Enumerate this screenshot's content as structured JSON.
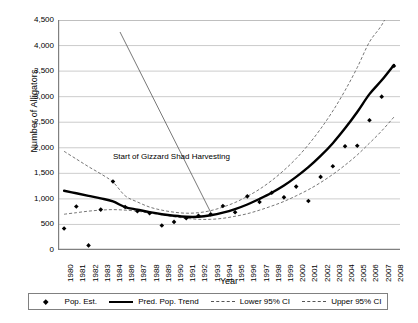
{
  "chart_data": {
    "type": "line",
    "title": "",
    "xlabel": "Year",
    "ylabel": "Number of Alligators",
    "ylim": [
      0,
      4500
    ],
    "ytick_step": 500,
    "yticks": [
      "4,500",
      "4,000",
      "3,500",
      "3,000",
      "2,500",
      "2,000",
      "1,500",
      "1,000",
      "500",
      "0"
    ],
    "grid": true,
    "legend_position": "bottom",
    "categories": [
      "1980",
      "1981",
      "1982",
      "1983",
      "1984",
      "1986",
      "1987",
      "1988",
      "1989",
      "1990",
      "1991",
      "1992",
      "1993",
      "1994",
      "1995",
      "1996",
      "1997",
      "1998",
      "1999",
      "2000",
      "2001",
      "2002",
      "2003",
      "2004",
      "2005",
      "2006",
      "2007",
      "2008"
    ],
    "annotations": [
      {
        "text": "Start of Gizzard Shad Harvesting",
        "points_to_category": "1993"
      }
    ],
    "series": [
      {
        "name": "Pop. Est.",
        "style": "marker",
        "values": [
          420,
          850,
          90,
          790,
          1340,
          840,
          760,
          720,
          480,
          550,
          620,
          670,
          700,
          860,
          740,
          1050,
          940,
          1120,
          1030,
          1240,
          960,
          1430,
          1640,
          2030,
          2040,
          2540,
          3000,
          3600
        ]
      },
      {
        "name": "Pred. Pop. Trend",
        "style": "solid-thick",
        "values": [
          1160,
          1110,
          1060,
          1010,
          950,
          840,
          790,
          740,
          700,
          670,
          650,
          650,
          680,
          730,
          800,
          890,
          1000,
          1120,
          1260,
          1430,
          1620,
          1840,
          2090,
          2380,
          2700,
          3050,
          3320,
          3620
        ]
      },
      {
        "name": "Lower 95% CI",
        "style": "dashed-thin",
        "values": [
          700,
          730,
          760,
          780,
          790,
          780,
          760,
          720,
          690,
          650,
          620,
          600,
          600,
          620,
          660,
          710,
          780,
          860,
          950,
          1060,
          1180,
          1320,
          1480,
          1660,
          1860,
          2090,
          2330,
          2600
        ]
      },
      {
        "name": "Upper 95% CI",
        "style": "dashed-thin",
        "values": [
          1930,
          1780,
          1630,
          1490,
          1330,
          1060,
          940,
          840,
          780,
          740,
          720,
          730,
          770,
          840,
          930,
          1050,
          1190,
          1360,
          1560,
          1790,
          2060,
          2370,
          2720,
          3120,
          3570,
          4070,
          4400,
          4850
        ]
      }
    ],
    "legend": [
      {
        "label": "Pop. Est.",
        "key": "marker"
      },
      {
        "label": "Pred. Pop. Trend",
        "key": "solid"
      },
      {
        "label": "Lower 95% CI",
        "key": "dash"
      },
      {
        "label": "Upper 95% CI",
        "key": "dash"
      }
    ],
    "colors": {
      "marker": "#000000",
      "trend": "#000000",
      "ci": "#666666",
      "grid": "#bfbfbf",
      "axis": "#808080",
      "text": "#000000"
    }
  }
}
